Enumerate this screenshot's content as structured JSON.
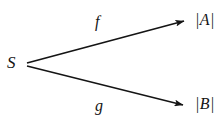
{
  "diagram": {
    "type": "mapping-diagram",
    "background_color": "#ffffff",
    "ink_color": "#141414",
    "nodes": [
      {
        "id": "source",
        "label": "S",
        "x": 18,
        "y": 63
      },
      {
        "id": "target_a",
        "label": "|A|",
        "x": 205,
        "y": 20
      },
      {
        "id": "target_b",
        "label": "|B|",
        "x": 205,
        "y": 105
      }
    ],
    "edges": [
      {
        "id": "f",
        "label": "f",
        "from": "source",
        "to": "target_a",
        "start_x": 27,
        "start_y": 63,
        "end_x": 189,
        "end_y": 20,
        "arrowhead": "solid-filled",
        "label_x": 101,
        "label_y": 22
      },
      {
        "id": "g",
        "label": "g",
        "from": "source",
        "to": "target_b",
        "start_x": 27,
        "start_y": 66,
        "end_x": 188,
        "end_y": 106,
        "arrowhead": "solid-filled",
        "label_x": 100,
        "label_y": 106
      }
    ]
  }
}
